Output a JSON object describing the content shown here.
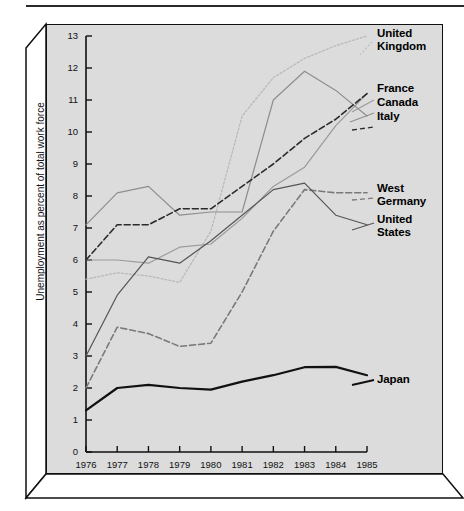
{
  "chart_data": {
    "type": "line",
    "title": "",
    "xlabel": "",
    "ylabel": "Unemployment as percent of total work force",
    "x": [
      1976,
      1977,
      1978,
      1979,
      1980,
      1981,
      1982,
      1983,
      1984,
      1985
    ],
    "xtick_labels": [
      "1976",
      "1977",
      "1978",
      "1979",
      "1980",
      "1981",
      "1982",
      "1983",
      "1984",
      "1985"
    ],
    "ytick_labels": [
      "0",
      "1",
      "2",
      "3",
      "4",
      "5",
      "6",
      "7",
      "8",
      "9",
      "10",
      "11",
      "12",
      "13"
    ],
    "ylim": [
      0,
      13
    ],
    "xlim": [
      1976,
      1985
    ],
    "grid": false,
    "legend_position": "right-inline-labels",
    "series": [
      {
        "name": "United Kingdom",
        "style": "dotted",
        "color": "#b9b9b9",
        "values": [
          5.4,
          5.6,
          5.5,
          5.3,
          6.9,
          10.5,
          11.7,
          12.3,
          12.7,
          13.0
        ]
      },
      {
        "name": "France",
        "style": "solid",
        "color": "#9a9a9a",
        "values": [
          6.0,
          6.0,
          5.9,
          6.4,
          6.5,
          7.3,
          8.3,
          8.9,
          10.2,
          11.2
        ]
      },
      {
        "name": "Canada",
        "style": "solid",
        "color": "#8e8e8e",
        "values": [
          7.1,
          8.1,
          8.3,
          7.4,
          7.5,
          7.5,
          11.0,
          11.9,
          11.3,
          10.5
        ]
      },
      {
        "name": "Italy",
        "style": "dashed",
        "color": "#2b2b2b",
        "values": [
          6.0,
          7.1,
          7.1,
          7.6,
          7.6,
          8.3,
          9.0,
          9.8,
          10.4,
          11.2
        ]
      },
      {
        "name": "West Germany",
        "style": "dashed",
        "color": "#7a7a7a",
        "values": [
          2.0,
          3.9,
          3.7,
          3.3,
          3.4,
          5.0,
          6.9,
          8.2,
          8.1,
          8.1
        ]
      },
      {
        "name": "United States",
        "style": "solid",
        "color": "#555555",
        "values": [
          3.0,
          4.9,
          6.1,
          5.9,
          6.6,
          7.4,
          8.2,
          8.4,
          7.4,
          7.1
        ]
      },
      {
        "name": "Japan",
        "style": "solid-bold",
        "color": "#111111",
        "values": [
          1.3,
          2.0,
          2.1,
          2.0,
          1.95,
          2.2,
          2.4,
          2.65,
          2.66,
          2.4
        ]
      }
    ],
    "annotations": [
      {
        "text": "United Kingdom",
        "lines": [
          "United",
          "Kingdom"
        ]
      },
      {
        "text": "France",
        "lines": [
          "France"
        ]
      },
      {
        "text": "Canada",
        "lines": [
          "Canada"
        ]
      },
      {
        "text": "Italy",
        "lines": [
          "Italy"
        ]
      },
      {
        "text": "West Germany",
        "lines": [
          "West",
          "Germany"
        ]
      },
      {
        "text": "United States",
        "lines": [
          "United",
          "States"
        ]
      },
      {
        "text": "Japan",
        "lines": [
          "Japan"
        ]
      }
    ]
  },
  "labels": {
    "uk_l1": "United",
    "uk_l2": "Kingdom",
    "france": "France",
    "canada": "Canada",
    "italy": "Italy",
    "wg_l1": "West",
    "wg_l2": "Germany",
    "us_l1": "United",
    "us_l2": "States",
    "japan": "Japan"
  },
  "axis": {
    "y_title": "Unemployment as percent of total work force",
    "y_ticks": [
      "13",
      "12",
      "11",
      "10",
      "9",
      "8",
      "7",
      "6",
      "5",
      "4",
      "3",
      "2",
      "1",
      "0"
    ],
    "x_ticks": [
      "1976",
      "1977",
      "1978",
      "1979",
      "1980",
      "1981",
      "1982",
      "1983",
      "1984",
      "1985"
    ]
  },
  "colors": {
    "panel_bg": "#dcdcdc",
    "frame": "#101010",
    "page_bg": "#ffffff",
    "text": "#111111"
  }
}
